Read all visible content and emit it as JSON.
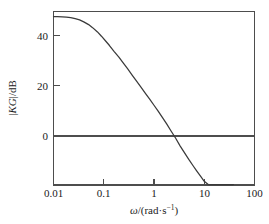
{
  "chart_data": {
    "type": "line",
    "title": "",
    "subtitle": "",
    "xlabel": "ω/(rad·s⁻¹)",
    "ylabel": "|KG|/dB",
    "xscale": "log",
    "yscale": "linear",
    "xlim": [
      0.01,
      100
    ],
    "ylim": [
      -30,
      49
    ],
    "grid": false,
    "legend": null,
    "legend_position": "none",
    "xticks": [
      0.01,
      0.1,
      1,
      10,
      100
    ],
    "xtick_labels": [
      "0.01",
      "0.1",
      "1",
      "10",
      "100"
    ],
    "yticks": [
      0,
      20,
      40
    ],
    "ytick_labels": [
      "0",
      "20",
      "40"
    ],
    "annotations": [
      {
        "name": "zero-db-line",
        "type": "horizontal-line",
        "y": 0
      }
    ],
    "series": [
      {
        "name": "magnitude",
        "color": "#3a3a3a",
        "x": [
          0.01,
          0.012,
          0.015,
          0.018,
          0.022,
          0.027,
          0.033,
          0.04,
          0.05,
          0.06,
          0.075,
          0.09,
          0.11,
          0.13,
          0.16,
          0.2,
          0.25,
          0.3,
          0.37,
          0.45,
          0.55,
          0.68,
          0.82,
          1.0,
          1.2,
          1.5,
          1.8,
          2.2,
          2.7,
          3.3,
          4.0,
          4.5,
          5.0,
          6.0,
          7.0,
          8.5,
          10.0,
          12.0,
          14.0,
          16.0,
          18.0,
          20.0,
          22.0,
          24.0,
          25.5,
          27.0,
          28.0,
          29.0,
          30.0,
          31.0,
          32.0,
          33.0,
          34.0,
          35.0,
          36.0,
          37.0,
          38.0
        ],
        "y": [
          47.4,
          47.4,
          47.3,
          47.2,
          47.0,
          46.6,
          46.1,
          45.3,
          44.2,
          43.0,
          41.3,
          39.6,
          37.6,
          35.9,
          33.6,
          31.3,
          28.7,
          26.6,
          24.1,
          21.8,
          19.4,
          16.8,
          14.6,
          12.2,
          10.0,
          7.1,
          4.7,
          1.9,
          -0.9,
          -3.9,
          -6.5,
          -8.1,
          -9.5,
          -11.8,
          -13.7,
          -16.0,
          -18.0,
          -20.0,
          -21.5,
          -22.7,
          -23.6,
          -24.3,
          -24.9,
          -25.2,
          -25.3,
          -25.0,
          -24.4,
          -23.3,
          -22.0,
          -21.0,
          -20.6,
          -21.2,
          -23.0,
          -26.0,
          -29.5,
          -33.5,
          -38.0
        ]
      }
    ]
  },
  "axes": {
    "y_label_text": "|KG|/dB",
    "y_label_parts": {
      "bars": "|",
      "italic": "KG",
      "unit": "/dB"
    },
    "x_label_parts": {
      "omega": "ω",
      "slash": "/(rad·s",
      "sup": "−1",
      "close": ")"
    }
  }
}
